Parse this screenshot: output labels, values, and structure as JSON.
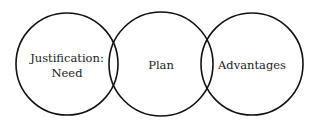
{
  "diagram": {
    "type": "overlapping-circles",
    "circles": [
      {
        "label_lines": [
          "Justification:",
          "Need"
        ],
        "cx": 67,
        "cy": 64,
        "r": 51
      },
      {
        "label_lines": [
          "Plan"
        ],
        "cx": 161,
        "cy": 64,
        "r": 52
      },
      {
        "label_lines": [
          "Advantages"
        ],
        "cx": 252,
        "cy": 64,
        "r": 51
      }
    ],
    "stroke_color": "#111111",
    "background": "#ffffff"
  }
}
